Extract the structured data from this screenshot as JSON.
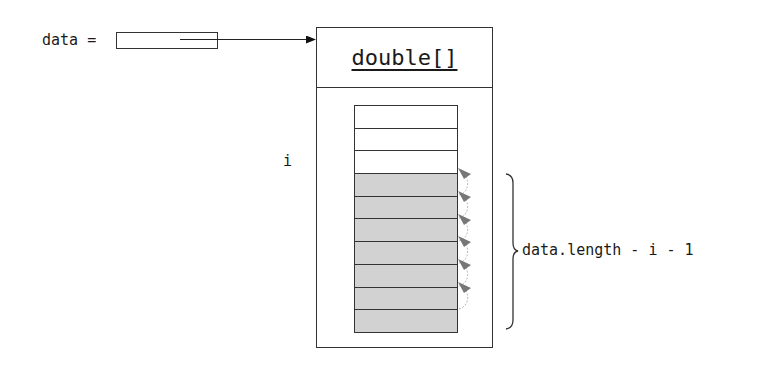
{
  "diagram": {
    "variable": {
      "name": "data",
      "label": "data ="
    },
    "object": {
      "type_label": "double[]"
    },
    "array": {
      "cell_count": 10,
      "cells": [
        {
          "index": 0,
          "shaded": false
        },
        {
          "index": 1,
          "shaded": false
        },
        {
          "index": 2,
          "shaded": false
        },
        {
          "index": 3,
          "shaded": true
        },
        {
          "index": 4,
          "shaded": true
        },
        {
          "index": 5,
          "shaded": true
        },
        {
          "index": 6,
          "shaded": true
        },
        {
          "index": 7,
          "shaded": true
        },
        {
          "index": 8,
          "shaded": true
        },
        {
          "index": 9,
          "shaded": true
        }
      ],
      "index_label": "i",
      "index_cell": 3,
      "shift_arrow_count": 6
    },
    "brace_label": "data.length - i - 1",
    "colors": {
      "line": "#333333",
      "shaded_cell": "#d2d2d2",
      "arrow_head": "#777777",
      "arrow_curve": "#bbbbbb"
    }
  }
}
